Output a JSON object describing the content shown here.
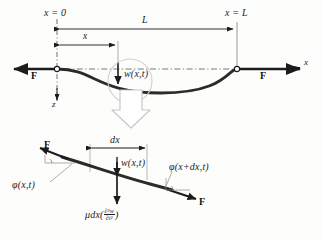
{
  "figure": {
    "background_color": "#fdfdfc",
    "line_color": "#1c1c1c",
    "string_color": "#2b2b2b"
  },
  "upper_diagram": {
    "name": "full-string-diagram",
    "labels": {
      "x_origin": "x = 0",
      "x_end": "x = L",
      "length": "L",
      "x_distance": "x",
      "deflection": "w(x,t)",
      "force_left": "F",
      "force_right": "F",
      "axis_x": "x",
      "axis_z": "z"
    }
  },
  "zoom_arrow": {
    "name": "zoom-callout-arrow",
    "direction": "down",
    "style": "hollow-outline"
  },
  "lower_diagram": {
    "name": "element-free-body-diagram",
    "labels": {
      "element_width": "dx",
      "deflection": "w(x,t)",
      "force_left": "F",
      "force_right": "F",
      "angle_left": "φ(x,t)",
      "angle_right": "φ(x+dx,t)",
      "inertia_prefix": "μdx(",
      "inertia_num": "∂²w",
      "inertia_den": "∂t²",
      "inertia_suffix": ")"
    }
  }
}
